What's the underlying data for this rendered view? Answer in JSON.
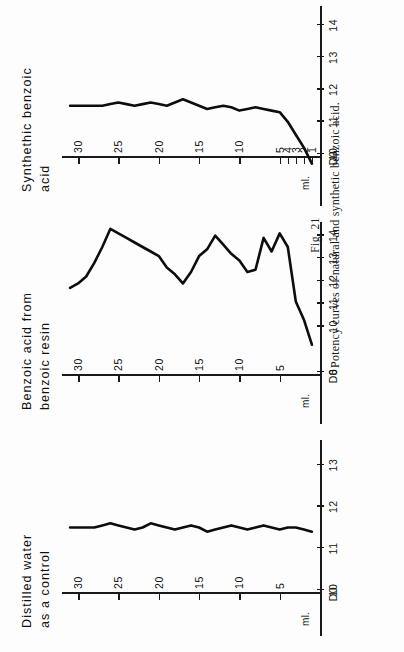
{
  "figure": {
    "number_label": "Fig. 21",
    "caption": "Potency curves of natural and synthetic benzoic acid."
  },
  "axes": {
    "x_tick_labels": [
      "5",
      "10",
      "15",
      "20",
      "25",
      "30"
    ],
    "x_values": [
      5,
      10,
      15,
      20,
      25,
      30
    ],
    "x_min": 0,
    "x_max": 32,
    "unit_label": "ml.",
    "origin_label": "D0"
  },
  "chart_data": [
    {
      "type": "line",
      "title": "Distilled water\nas a control",
      "panel_id": "panel-1",
      "xlabel": "",
      "ylabel": "ml.",
      "ylim": [
        10,
        13.6
      ],
      "y_tick_labels": [
        "10",
        "11",
        "12",
        "13"
      ],
      "y_values": [
        10,
        11,
        12,
        13
      ],
      "x": [
        1,
        2,
        3,
        4,
        5,
        6,
        7,
        8,
        9,
        10,
        11,
        12,
        13,
        14,
        15,
        16,
        17,
        18,
        19,
        20,
        21,
        22,
        23,
        24,
        25,
        26,
        27,
        28,
        29,
        30,
        31
      ],
      "values": [
        11.4,
        11.45,
        11.5,
        11.5,
        11.45,
        11.5,
        11.55,
        11.5,
        11.45,
        11.5,
        11.55,
        11.5,
        11.45,
        11.4,
        11.5,
        11.55,
        11.5,
        11.45,
        11.5,
        11.55,
        11.6,
        11.5,
        11.45,
        11.5,
        11.55,
        11.6,
        11.55,
        11.5,
        11.5,
        11.5,
        11.5
      ]
    },
    {
      "type": "line",
      "title": "Benzoic acid from\nbenzoic resin",
      "panel_id": "panel-2",
      "xlabel": "",
      "ylabel": "ml.",
      "ylim": [
        8,
        14.6
      ],
      "y_tick_labels": [
        "8",
        "10",
        "11",
        "12",
        "13",
        "14"
      ],
      "y_values": [
        8,
        10,
        11,
        12,
        13,
        14
      ],
      "x": [
        1,
        2,
        3,
        4,
        5,
        6,
        7,
        8,
        9,
        10,
        11,
        12,
        13,
        14,
        15,
        16,
        17,
        18,
        19,
        20,
        21,
        22,
        23,
        24,
        25,
        26,
        27,
        28,
        29,
        30,
        31
      ],
      "values": [
        9.2,
        10.3,
        11.1,
        13.5,
        14.1,
        13.3,
        13.9,
        12.5,
        12.4,
        12.9,
        13.2,
        13.6,
        14.0,
        13.4,
        13.1,
        12.4,
        11.9,
        12.3,
        12.6,
        13.1,
        13.3,
        13.5,
        13.7,
        13.9,
        14.1,
        14.3,
        13.5,
        12.8,
        12.2,
        11.9,
        11.7
      ]
    },
    {
      "type": "line",
      "title": "Synthethic benzoic\nacid",
      "panel_id": "panel-3",
      "xlabel": "",
      "ylabel": "ml.",
      "ylim": [
        10,
        14.6
      ],
      "y_tick_labels": [
        "10",
        "11",
        "12",
        "13",
        "14"
      ],
      "y_values": [
        10,
        11,
        12,
        13,
        14
      ],
      "x_extra_tick_labels": [
        "1",
        "2",
        "3",
        "4",
        "5"
      ],
      "x": [
        1,
        2,
        3,
        4,
        5,
        6,
        7,
        8,
        9,
        10,
        11,
        12,
        13,
        14,
        15,
        16,
        17,
        18,
        19,
        20,
        21,
        22,
        23,
        24,
        25,
        26,
        27,
        28,
        29,
        30,
        31
      ],
      "values": [
        9.7,
        10.2,
        10.6,
        11.0,
        11.3,
        11.35,
        11.4,
        11.45,
        11.4,
        11.35,
        11.45,
        11.5,
        11.45,
        11.4,
        11.5,
        11.6,
        11.7,
        11.6,
        11.5,
        11.55,
        11.6,
        11.55,
        11.5,
        11.55,
        11.6,
        11.55,
        11.5,
        11.5,
        11.5,
        11.5,
        11.5
      ]
    }
  ],
  "colors": {
    "ink": "#0d0d0d",
    "paper": "#fdfdfd"
  }
}
